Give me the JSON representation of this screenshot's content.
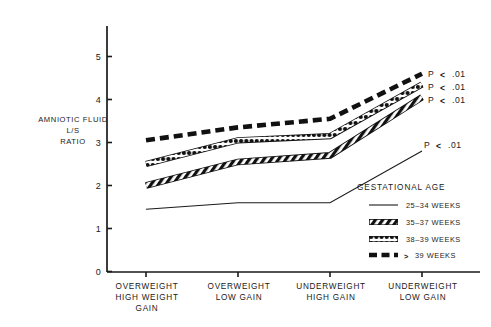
{
  "chart_data": {
    "type": "line",
    "title": "",
    "subtitle": "",
    "ylabel": "AMNIOTIC FLUID L/S RATIO",
    "ylabel_lines": [
      "AMNIOTIC FLUID",
      "L/S",
      "RATIO"
    ],
    "xlabel": "",
    "ylim": [
      0,
      5.4
    ],
    "yticks": [
      0,
      1,
      2,
      3,
      4,
      5
    ],
    "ytick_labels": [
      "0",
      "1",
      "2",
      "3",
      "4",
      "5"
    ],
    "grid": false,
    "legend_position": "inside-lower-right",
    "legend_title": "GESTATIONAL AGE",
    "categories": [
      "OVERWEIGHT HIGH WEIGHT GAIN",
      "OVERWEIGHT LOW GAIN",
      "UNDERWEIGHT HIGH GAIN",
      "UNDERWEIGHT LOW GAIN"
    ],
    "category_lines": [
      [
        "OVERWEIGHT",
        "HIGH WEIGHT",
        "GAIN"
      ],
      [
        "OVERWEIGHT",
        "LOW GAIN"
      ],
      [
        "UNDERWEIGHT",
        "HIGH GAIN"
      ],
      [
        "UNDERWEIGHT",
        "LOW GAIN"
      ]
    ],
    "series": [
      {
        "name": "25-34 WEEKS",
        "style": "thin-solid",
        "values": [
          1.45,
          1.6,
          1.6,
          2.8
        ],
        "annotation": "P < .01"
      },
      {
        "name": "35-37 WEEKS",
        "style": "hatched",
        "values": [
          2.0,
          2.55,
          2.7,
          4.05
        ],
        "annotation": "P < .01"
      },
      {
        "name": "38-39 WEEKS",
        "style": "beaded",
        "values": [
          2.5,
          3.05,
          3.15,
          4.35
        ],
        "annotation": "P < .01"
      },
      {
        "name": "> 39 WEEKS",
        "style": "dashed",
        "values": [
          3.05,
          3.35,
          3.55,
          4.6
        ],
        "annotation": "P < .01"
      }
    ],
    "annotations": [
      {
        "text": "P < .01",
        "for_series": "> 39 WEEKS"
      },
      {
        "text": "P < .01",
        "for_series": "38-39 WEEKS"
      },
      {
        "text": "P < .01",
        "for_series": "35-37 WEEKS"
      },
      {
        "text": "P < .01",
        "for_series": "25-34 WEEKS"
      }
    ]
  },
  "axis": {
    "ytick_0": "0",
    "ytick_1": "1",
    "ytick_2": "2",
    "ytick_3": "3",
    "ytick_4": "4",
    "ytick_5": "5"
  },
  "ylabel": {
    "line1": "AMNIOTIC FLUID",
    "line2": "L/S",
    "line3": "RATIO"
  },
  "xlabels": {
    "c0l0": "OVERWEIGHT",
    "c0l1": "HIGH WEIGHT",
    "c0l2": "GAIN",
    "c1l0": "OVERWEIGHT",
    "c1l1": "LOW GAIN",
    "c2l0": "UNDERWEIGHT",
    "c2l1": "HIGH GAIN",
    "c3l0": "UNDERWEIGHT",
    "c3l1": "LOW GAIN"
  },
  "pvalues": {
    "p1": "P",
    "p1sym": "<",
    "p1val": ".01",
    "p2": "P",
    "p2sym": "<",
    "p2val": ".01",
    "p3": "P",
    "p3sym": "<",
    "p3val": ".01",
    "p4": "P",
    "p4sym": "<",
    "p4val": ".01"
  },
  "legend": {
    "title": "GESTATIONAL AGE",
    "item0": "25–34 WEEKS",
    "item1": "35–37 WEEKS",
    "item2": "38–39 WEEKS",
    "item3_sym": ">",
    "item3": "39 WEEKS"
  },
  "colors": {
    "ink": "#1a1a1a",
    "background": "#ffffff"
  }
}
